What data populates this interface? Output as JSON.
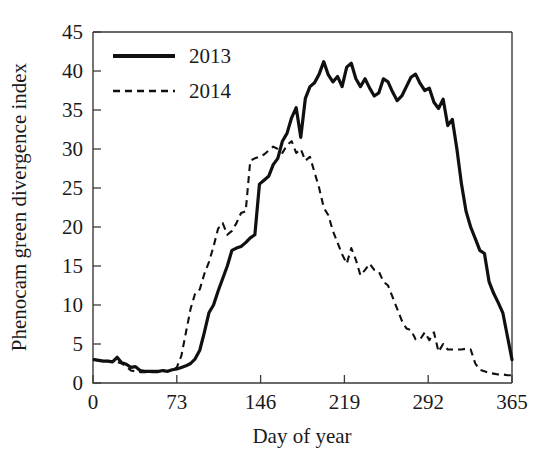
{
  "chart_data": {
    "type": "line",
    "title": "",
    "xlabel": "Day of year",
    "ylabel": "Phenocam green divergence index",
    "xlim": [
      0,
      365
    ],
    "ylim": [
      0,
      45
    ],
    "xticks": [
      0,
      73,
      146,
      219,
      292,
      365
    ],
    "yticks": [
      0,
      5,
      10,
      15,
      20,
      25,
      30,
      35,
      40,
      45
    ],
    "grid": false,
    "legend_position": "upper-left",
    "series": [
      {
        "name": "2013",
        "style": "solid",
        "color": "#101010",
        "x": [
          1,
          5,
          9,
          13,
          17,
          21,
          25,
          29,
          33,
          37,
          41,
          45,
          49,
          53,
          57,
          61,
          65,
          69,
          73,
          77,
          81,
          85,
          89,
          93,
          97,
          101,
          105,
          109,
          113,
          117,
          121,
          125,
          129,
          133,
          137,
          141,
          145,
          149,
          153,
          157,
          161,
          165,
          169,
          173,
          177,
          181,
          185,
          189,
          193,
          197,
          201,
          205,
          209,
          213,
          217,
          221,
          225,
          229,
          233,
          237,
          241,
          245,
          249,
          253,
          257,
          261,
          265,
          269,
          273,
          277,
          281,
          285,
          289,
          293,
          297,
          301,
          305,
          309,
          313,
          317,
          321,
          325,
          329,
          333,
          337,
          341,
          345,
          349,
          353,
          357,
          361,
          365
        ],
        "y": [
          3.0,
          2.9,
          2.8,
          2.8,
          2.7,
          3.3,
          2.6,
          2.4,
          2.0,
          2.1,
          1.6,
          1.5,
          1.5,
          1.5,
          1.5,
          1.6,
          1.5,
          1.7,
          1.8,
          2.0,
          2.2,
          2.5,
          3.1,
          4.2,
          6.5,
          9.0,
          10.0,
          11.8,
          13.4,
          15.0,
          17.0,
          17.3,
          17.5,
          18.0,
          18.6,
          19.0,
          25.5,
          26.0,
          26.5,
          28.0,
          28.8,
          31.0,
          32.0,
          34.0,
          35.3,
          31.5,
          36.5,
          38.0,
          38.5,
          39.6,
          41.2,
          39.5,
          38.6,
          39.3,
          38.0,
          40.5,
          41.0,
          39.0,
          38.0,
          39.0,
          37.8,
          36.8,
          37.2,
          39.0,
          38.6,
          37.3,
          36.2,
          36.8,
          38.0,
          39.2,
          39.6,
          38.4,
          37.5,
          37.8,
          36.0,
          35.2,
          36.4,
          33.0,
          33.8,
          30.0,
          25.5,
          22.0,
          20.0,
          18.5,
          17.0,
          16.6,
          13.0,
          11.5,
          10.3,
          9.0,
          6.0,
          3.0
        ]
      },
      {
        "name": "2014",
        "style": "dashed",
        "color": "#101010",
        "x": [
          1,
          5,
          9,
          13,
          17,
          21,
          25,
          29,
          33,
          37,
          41,
          45,
          49,
          53,
          57,
          61,
          65,
          69,
          73,
          77,
          81,
          85,
          89,
          93,
          97,
          101,
          105,
          109,
          113,
          117,
          121,
          125,
          129,
          133,
          137,
          141,
          145,
          149,
          153,
          157,
          161,
          165,
          169,
          173,
          177,
          181,
          185,
          189,
          193,
          197,
          201,
          205,
          209,
          213,
          217,
          221,
          225,
          229,
          233,
          237,
          241,
          245,
          249,
          253,
          257,
          261,
          265,
          269,
          273,
          277,
          281,
          285,
          289,
          293,
          297,
          301,
          305,
          309,
          313,
          317,
          321,
          325,
          329,
          333,
          337,
          341,
          345,
          349,
          353,
          357,
          361,
          365
        ],
        "y": [
          3.0,
          2.9,
          2.9,
          2.8,
          2.8,
          2.7,
          2.5,
          2.1,
          1.6,
          1.5,
          1.4,
          1.4,
          1.4,
          1.4,
          1.4,
          1.5,
          1.5,
          1.6,
          2.0,
          3.5,
          6.5,
          9.5,
          11.5,
          12.0,
          14.0,
          15.5,
          17.5,
          19.8,
          20.5,
          19.0,
          19.5,
          20.5,
          21.8,
          22.0,
          28.5,
          28.8,
          29.0,
          29.3,
          29.8,
          30.3,
          30.0,
          29.5,
          30.5,
          31.0,
          29.5,
          30.0,
          28.5,
          29.0,
          27.0,
          25.0,
          22.5,
          21.5,
          19.5,
          18.0,
          16.5,
          15.3,
          17.3,
          15.8,
          13.8,
          14.5,
          15.3,
          14.5,
          14.3,
          13.0,
          12.5,
          11.0,
          9.5,
          8.0,
          7.0,
          6.8,
          5.6,
          5.6,
          6.5,
          5.5,
          6.5,
          4.0,
          5.0,
          4.3,
          4.3,
          4.3,
          4.3,
          4.4,
          4.3,
          2.5,
          1.7,
          1.5,
          1.3,
          1.2,
          1.1,
          1.1,
          1.0,
          1.0
        ]
      }
    ]
  },
  "legend": {
    "entries": [
      {
        "label": "2013"
      },
      {
        "label": "2014"
      }
    ]
  },
  "axes": {
    "x_title": "Day of year",
    "y_title": "Phenocam green divergence index",
    "x_tick_labels": [
      "0",
      "73",
      "146",
      "219",
      "292",
      "365"
    ],
    "y_tick_labels": [
      "0",
      "5",
      "10",
      "15",
      "20",
      "25",
      "30",
      "35",
      "40",
      "45"
    ]
  },
  "colors": {
    "line": "#101010",
    "axis": "#3a3a3a",
    "background": "#ffffff"
  }
}
